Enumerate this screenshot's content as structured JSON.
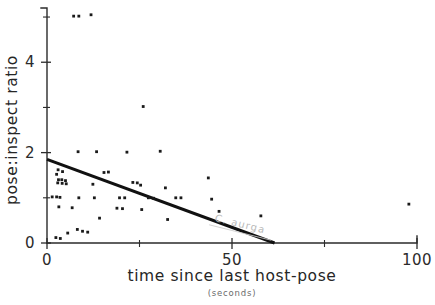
{
  "chart_data": {
    "type": "scatter",
    "title": "",
    "xlabel": "time since last host-pose",
    "xlabel_units": "(seconds)",
    "ylabel": "pose:inspect ratio",
    "xlim": [
      0,
      100
    ],
    "ylim": [
      0,
      5.2
    ],
    "grid": false,
    "legend": null,
    "x_ticks": [
      0,
      50,
      100
    ],
    "x_tick_labels": [
      "0",
      "50",
      "100"
    ],
    "x_minor_ticks": [
      25,
      75
    ],
    "y_ticks": [
      0,
      2,
      4
    ],
    "y_tick_labels": [
      "0",
      "2",
      "4"
    ],
    "y_minor_ticks": [
      1,
      3,
      5
    ],
    "annotations": [
      {
        "name": "scan-watermark",
        "text": "C. aurga",
        "x": 52,
        "y": 0.35,
        "rotation": 14
      }
    ],
    "series": [
      {
        "name": "observations",
        "marker": "dot",
        "color": "#1a1a1a",
        "points": [
          [
            7.2,
            5.02
          ],
          [
            8.6,
            5.02
          ],
          [
            11.9,
            5.05
          ],
          [
            26.0,
            3.02
          ],
          [
            8.4,
            2.02
          ],
          [
            13.4,
            2.02
          ],
          [
            21.6,
            2.01
          ],
          [
            30.6,
            2.03
          ],
          [
            3.0,
            1.62
          ],
          [
            4.2,
            1.58
          ],
          [
            2.6,
            1.52
          ],
          [
            15.4,
            1.56
          ],
          [
            16.6,
            1.57
          ],
          [
            3.1,
            1.4
          ],
          [
            4.0,
            1.4
          ],
          [
            5.0,
            1.38
          ],
          [
            2.9,
            1.33
          ],
          [
            4.1,
            1.32
          ],
          [
            5.2,
            1.31
          ],
          [
            12.4,
            1.3
          ],
          [
            23.2,
            1.34
          ],
          [
            24.4,
            1.33
          ],
          [
            25.3,
            1.28
          ],
          [
            32.0,
            1.22
          ],
          [
            43.6,
            1.44
          ],
          [
            1.4,
            1.02
          ],
          [
            2.6,
            1.02
          ],
          [
            3.5,
            1.01
          ],
          [
            8.6,
            1.0
          ],
          [
            12.8,
            1.0
          ],
          [
            19.6,
            1.0
          ],
          [
            21.0,
            1.0
          ],
          [
            27.4,
            1.0
          ],
          [
            28.8,
            0.99
          ],
          [
            34.8,
            1.0
          ],
          [
            36.2,
            1.0
          ],
          [
            44.5,
            0.97
          ],
          [
            97.8,
            0.86
          ],
          [
            3.2,
            0.8
          ],
          [
            6.8,
            0.78
          ],
          [
            18.9,
            0.77
          ],
          [
            20.4,
            0.76
          ],
          [
            25.6,
            0.74
          ],
          [
            46.5,
            0.7
          ],
          [
            14.2,
            0.55
          ],
          [
            32.6,
            0.52
          ],
          [
            57.8,
            0.6
          ],
          [
            8.2,
            0.3
          ],
          [
            9.6,
            0.26
          ],
          [
            11.0,
            0.24
          ],
          [
            5.6,
            0.22
          ],
          [
            2.4,
            0.12
          ],
          [
            3.6,
            0.1
          ]
        ]
      }
    ],
    "fit_line": {
      "name": "regression-line",
      "x_start": 0,
      "y_start": 1.85,
      "x_end": 61.5,
      "y_end": 0.0,
      "color": "#111111"
    }
  }
}
